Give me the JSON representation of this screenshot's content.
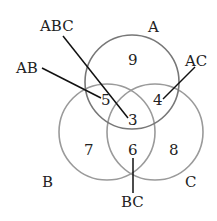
{
  "diagram": {
    "type": "venn",
    "sets": [
      {
        "name": "A",
        "cx": 132,
        "cy": 82,
        "r": 47,
        "stroke": "#777777"
      },
      {
        "name": "B",
        "cx": 107,
        "cy": 132,
        "r": 48,
        "stroke": "#9a9a9a"
      },
      {
        "name": "C",
        "cx": 155,
        "cy": 132,
        "r": 48,
        "stroke": "#9a9a9a"
      }
    ],
    "set_labels": {
      "A": "A",
      "B": "B",
      "C": "C"
    },
    "regions": {
      "A_only": "9",
      "B_only": "7",
      "C_only": "8",
      "AB": "5",
      "AC": "4",
      "BC": "6",
      "ABC": "3"
    },
    "callouts": {
      "ABC": "ABC",
      "AB": "AB",
      "AC": "AC",
      "BC": "BC"
    }
  }
}
